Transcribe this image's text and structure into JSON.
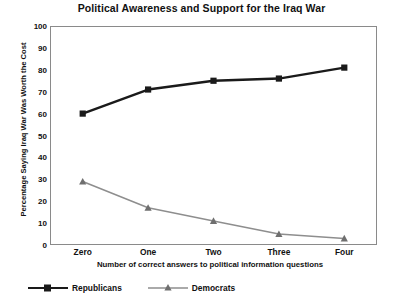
{
  "chart_data": {
    "type": "line",
    "title": "Political Awareness and Support for the Iraq War",
    "xlabel": "Number of correct answers to political information questions",
    "ylabel": "Percentage Saying Iraq War Was Worth the Cost",
    "categories": [
      "Zero",
      "One",
      "Two",
      "Three",
      "Four"
    ],
    "series": [
      {
        "name": "Republicans",
        "values": [
          60,
          71,
          75,
          76,
          81
        ],
        "color": "#1a1a1a",
        "marker": "square"
      },
      {
        "name": "Democrats",
        "values": [
          29,
          17,
          11,
          5,
          3
        ],
        "color": "#8e8e8e",
        "marker": "triangle"
      }
    ],
    "ylim": [
      0,
      100
    ],
    "yticks": [
      100,
      90,
      80,
      70,
      60,
      50,
      40,
      30,
      20,
      10,
      0
    ],
    "grid": false,
    "legend_position": "bottom-left"
  },
  "legend": {
    "entries": [
      {
        "label": "Republicans"
      },
      {
        "label": "Democrats"
      }
    ]
  }
}
